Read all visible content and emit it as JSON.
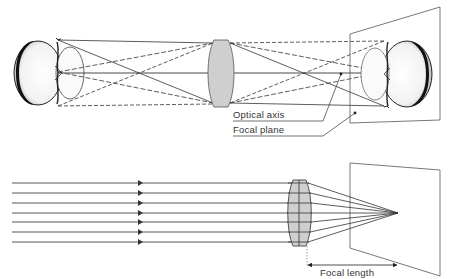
{
  "diagram": {
    "top_panel": {
      "description": "Image formation by a lens: object (halved apple) imaged inverted on focal plane",
      "labels": {
        "optical_axis": "Optical axis",
        "focal_plane": "Focal plane"
      }
    },
    "bottom_panel": {
      "description": "Parallel rays converging through a lens to the focal point",
      "ray_count": 7,
      "labels": {
        "focal_length": "Focal length"
      }
    },
    "colors": {
      "line": "#333333",
      "lens_fill": "#cfcfcf",
      "lens_stroke": "#555555",
      "background": "#ffffff"
    }
  }
}
